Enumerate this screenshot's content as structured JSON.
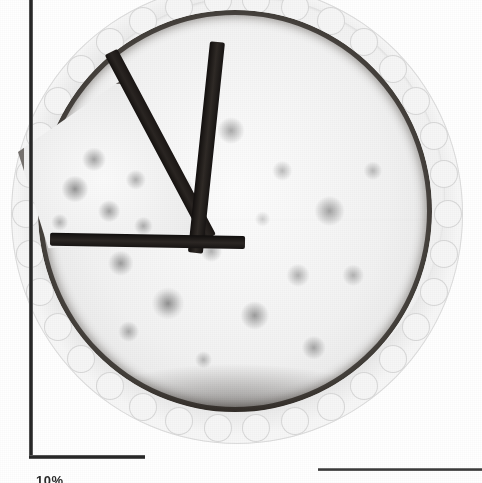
{
  "figure": {
    "axis_label": "10%",
    "colors": {
      "background": "#ffffff",
      "axis": "#2e2e2e",
      "plate": "#f4f4f4",
      "filling": "#f2f2f2",
      "crust": "#2a2522",
      "cut_face": "#1d1a18"
    }
  },
  "axes": {
    "y_axis_name": "vertical-axis",
    "x_axis_name": "horizontal-axis",
    "x_axis_right_name": "horizontal-axis-right-segment"
  },
  "chart_data": {
    "type": "pie",
    "title": "",
    "subtitle": "",
    "xlabel": "",
    "ylabel": "",
    "legend_position": "none",
    "grid": false,
    "labels": [
      "Slice (cut out)",
      "Remaining pie"
    ],
    "values": [
      12.5,
      87.5
    ],
    "units": "%",
    "annotations": [
      "10%"
    ]
  }
}
